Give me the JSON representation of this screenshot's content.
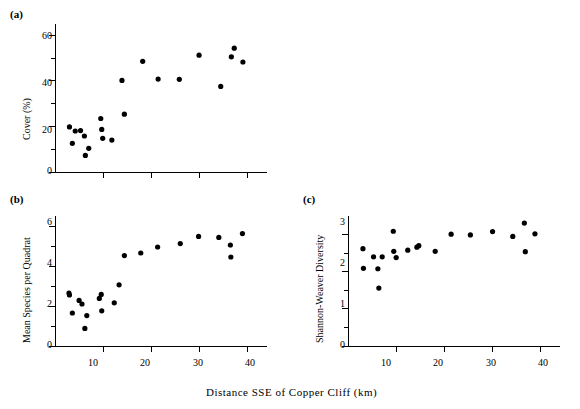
{
  "figure": {
    "xaxis_title": "Distance SSE of Copper Cliff (km)",
    "caption": "",
    "panel_a_label": "(a)",
    "panel_b_label": "(b)",
    "panel_c_label": "(c)"
  },
  "chart_data": [
    {
      "id": "panel-a",
      "type": "scatter",
      "panel": "(a)",
      "title": "",
      "xlabel": "Distance SSE of Copper Cliff (km)",
      "ylabel": "Cover (%)",
      "xlim": [
        0,
        44
      ],
      "ylim": [
        0,
        65
      ],
      "xticks_major": [
        10,
        20,
        30,
        40
      ],
      "xticklabels": [
        "",
        "",
        "",
        ""
      ],
      "yticks_major": [
        0,
        20,
        40,
        60
      ],
      "yticklabels": [
        "0",
        "20",
        "40",
        "60"
      ],
      "yticks_minor": [
        10,
        30,
        50
      ],
      "grid": false,
      "legend": null,
      "marker": "filled-circle",
      "marker_color": "#000000",
      "points": [
        {
          "x": 3.0,
          "y": 19.8
        },
        {
          "x": 3.6,
          "y": 12.6
        },
        {
          "x": 4.2,
          "y": 18.0
        },
        {
          "x": 5.3,
          "y": 18.2
        },
        {
          "x": 6.1,
          "y": 15.8
        },
        {
          "x": 6.3,
          "y": 7.3
        },
        {
          "x": 7.0,
          "y": 10.4
        },
        {
          "x": 9.5,
          "y": 23.5
        },
        {
          "x": 9.7,
          "y": 18.7
        },
        {
          "x": 9.9,
          "y": 14.8
        },
        {
          "x": 11.8,
          "y": 14.0
        },
        {
          "x": 13.9,
          "y": 40.2
        },
        {
          "x": 14.4,
          "y": 25.4
        },
        {
          "x": 18.2,
          "y": 48.6
        },
        {
          "x": 21.4,
          "y": 40.8
        },
        {
          "x": 25.8,
          "y": 40.7
        },
        {
          "x": 29.9,
          "y": 51.3
        },
        {
          "x": 34.4,
          "y": 37.6
        },
        {
          "x": 36.6,
          "y": 50.6
        },
        {
          "x": 37.2,
          "y": 54.4
        },
        {
          "x": 39.0,
          "y": 48.3
        }
      ]
    },
    {
      "id": "panel-b",
      "type": "scatter",
      "panel": "(b)",
      "title": "",
      "xlabel": "Distance SSE of Copper Cliff (km)",
      "ylabel": "Mean Species per Quadrat",
      "xlim": [
        0,
        44
      ],
      "ylim": [
        0,
        6.5
      ],
      "xticks_major": [
        10,
        20,
        30,
        40
      ],
      "xticklabels": [
        "10",
        "20",
        "30",
        "40"
      ],
      "yticks_major": [
        0,
        2,
        4,
        6
      ],
      "yticklabels": [
        "0",
        "2",
        "4",
        "6"
      ],
      "yticks_minor": [
        1,
        3,
        5
      ],
      "grid": false,
      "legend": null,
      "marker": "filled-circle",
      "marker_color": "#000000",
      "points": [
        {
          "x": 2.9,
          "y": 2.65
        },
        {
          "x": 3.0,
          "y": 2.55
        },
        {
          "x": 3.6,
          "y": 1.65
        },
        {
          "x": 5.0,
          "y": 2.28
        },
        {
          "x": 5.6,
          "y": 2.1
        },
        {
          "x": 6.2,
          "y": 0.88
        },
        {
          "x": 6.6,
          "y": 1.52
        },
        {
          "x": 9.2,
          "y": 2.38
        },
        {
          "x": 9.6,
          "y": 2.58
        },
        {
          "x": 9.7,
          "y": 1.76
        },
        {
          "x": 12.3,
          "y": 2.16
        },
        {
          "x": 13.3,
          "y": 3.06
        },
        {
          "x": 14.4,
          "y": 4.52
        },
        {
          "x": 17.8,
          "y": 4.65
        },
        {
          "x": 21.3,
          "y": 4.95
        },
        {
          "x": 26.0,
          "y": 5.12
        },
        {
          "x": 29.8,
          "y": 5.48
        },
        {
          "x": 34.0,
          "y": 5.43
        },
        {
          "x": 36.4,
          "y": 5.05
        },
        {
          "x": 36.5,
          "y": 4.45
        },
        {
          "x": 38.9,
          "y": 5.62
        }
      ]
    },
    {
      "id": "panel-c",
      "type": "scatter",
      "panel": "(c)",
      "title": "",
      "xlabel": "Distance SSE of Copper Cliff (km)",
      "ylabel": "Shannon-Weaver Diversity",
      "xlim": [
        0,
        44
      ],
      "ylim": [
        0,
        3.5
      ],
      "xticks_major": [
        10,
        20,
        30,
        40
      ],
      "xticklabels": [
        "10",
        "20",
        "30",
        "40"
      ],
      "yticks_major": [
        0,
        1,
        2,
        3
      ],
      "yticklabels": [
        "0",
        "1",
        "2",
        "3"
      ],
      "yticks_minor": [
        0.5,
        1.5,
        2.5
      ],
      "grid": false,
      "legend": null,
      "marker": "filled-circle",
      "marker_color": "#000000",
      "points": [
        {
          "x": 3.1,
          "y": 2.62
        },
        {
          "x": 3.2,
          "y": 2.09
        },
        {
          "x": 5.3,
          "y": 2.4
        },
        {
          "x": 6.2,
          "y": 2.08
        },
        {
          "x": 6.4,
          "y": 1.56
        },
        {
          "x": 7.1,
          "y": 2.4
        },
        {
          "x": 9.4,
          "y": 3.09
        },
        {
          "x": 9.5,
          "y": 2.55
        },
        {
          "x": 10.0,
          "y": 2.38
        },
        {
          "x": 12.4,
          "y": 2.58
        },
        {
          "x": 14.3,
          "y": 2.66
        },
        {
          "x": 14.7,
          "y": 2.7
        },
        {
          "x": 18.1,
          "y": 2.55
        },
        {
          "x": 21.4,
          "y": 3.01
        },
        {
          "x": 25.4,
          "y": 2.99
        },
        {
          "x": 30.0,
          "y": 3.08
        },
        {
          "x": 34.2,
          "y": 2.95
        },
        {
          "x": 36.6,
          "y": 3.31
        },
        {
          "x": 36.8,
          "y": 2.54
        },
        {
          "x": 38.8,
          "y": 3.02
        }
      ]
    }
  ]
}
